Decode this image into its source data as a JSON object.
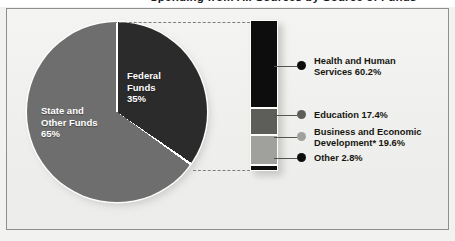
{
  "title": "Spending from All Sources by Source of Funds",
  "pie": {
    "slices": [
      {
        "label": "Federal\nFunds",
        "percent_text": "35%",
        "value": 35,
        "color": "#2b2b2b"
      },
      {
        "label": "State and\nOther Funds",
        "percent_text": "65%",
        "value": 65,
        "color": "#6e6e6e"
      }
    ]
  },
  "bar": {
    "segments": [
      {
        "name": "Health and Human Services",
        "value": 60.2,
        "color": "#0d0d0d"
      },
      {
        "name": "Education",
        "value": 17.4,
        "color": "#5d5d5a"
      },
      {
        "name": "Business and Economic Development",
        "value": 19.6,
        "color": "#a0a09c"
      },
      {
        "name": "Other",
        "value": 2.8,
        "color": "#0d0d0d"
      }
    ]
  },
  "legend": {
    "items": [
      {
        "label": "Health and Human\nServices   60.2%",
        "color": "#0d0d0d"
      },
      {
        "label": "Education 17.4%",
        "color": "#5d5d5a"
      },
      {
        "label": "Business and Economic\nDevelopment* 19.6%",
        "color": "#a0a09c"
      },
      {
        "label": "Other 2.8%",
        "color": "#0d0d0d"
      }
    ]
  },
  "chart_data": {
    "type": "pie",
    "title": "Spending from All Sources by Source of Funds",
    "categories": [
      "Federal Funds",
      "State and Other Funds"
    ],
    "values": [
      35,
      65
    ],
    "labels": [
      "Federal Funds 35%",
      "State and Other Funds 65%"
    ],
    "breakout": {
      "type": "bar",
      "orientation": "vertical-stacked",
      "of_slice": "Federal Funds",
      "categories": [
        "Health and Human Services",
        "Education",
        "Business and Economic Development*",
        "Other"
      ],
      "values": [
        60.2,
        17.4,
        19.6,
        2.8
      ],
      "unit": "percent",
      "total": 100.0
    },
    "footnote_marker": "*",
    "legend_position": "right",
    "grid": false
  }
}
